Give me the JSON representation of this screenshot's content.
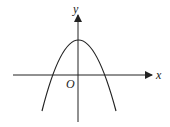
{
  "diagram": {
    "type": "coordinate-plot",
    "axes": {
      "x_label": "x",
      "y_label": "y",
      "origin_label": "O"
    },
    "curve": {
      "kind": "parabola",
      "opens": "down",
      "vertex_on_y_axis": true,
      "vertex_above_x_axis": true,
      "roots": "two, symmetric about y-axis"
    },
    "colors": {
      "stroke": "#222222",
      "background": "#ffffff"
    }
  }
}
